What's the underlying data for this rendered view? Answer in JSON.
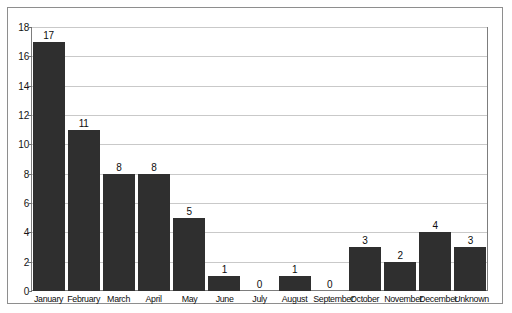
{
  "chart_data": {
    "type": "bar",
    "title": "",
    "subtitle": "",
    "xlabel": "",
    "ylabel": "",
    "categories": [
      "January",
      "February",
      "March",
      "April",
      "May",
      "June",
      "July",
      "August",
      "September",
      "October",
      "November",
      "December",
      "Unknown"
    ],
    "values": [
      17,
      11,
      8,
      8,
      5,
      1,
      0,
      1,
      0,
      3,
      2,
      4,
      3
    ],
    "data_labels": [
      "17",
      "11",
      "8",
      "8",
      "5",
      "1",
      "0",
      "1",
      "0",
      "3",
      "2",
      "4",
      "3"
    ],
    "ylim": [
      0,
      18
    ],
    "ytick_values": [
      0,
      2,
      4,
      6,
      8,
      10,
      12,
      14,
      16,
      18
    ],
    "ytick_labels": [
      "0",
      "2",
      "4",
      "6",
      "8",
      "10",
      "12",
      "14",
      "16",
      "18"
    ],
    "grid": true,
    "grid_axis": "y",
    "legend": false,
    "legend_position": "none",
    "bar_color": "#2f2f2f",
    "grid_color": "#c9c9c9",
    "axis_color": "#7d7d7d",
    "frame_color": "#8e8e8e",
    "background": "#ffffff"
  }
}
